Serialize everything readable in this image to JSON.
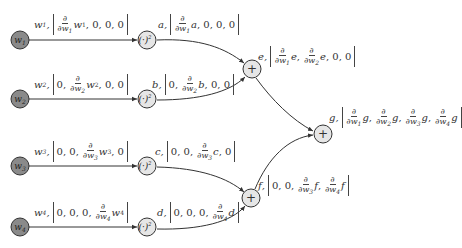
{
  "colors": {
    "input_node_fill": "#8a8a8a",
    "op_node_fill": "#e6e6e6",
    "stroke": "#333333"
  },
  "inputs": [
    {
      "id": "w1",
      "label": "w",
      "sub": "1",
      "cx": 20,
      "cy": 40,
      "tuple_var": "w",
      "tuple_sub": "1",
      "vector": [
        "∂/∂w₁ w₁",
        "0",
        "0",
        "0"
      ]
    },
    {
      "id": "w2",
      "label": "w",
      "sub": "2",
      "cx": 20,
      "cy": 99,
      "tuple_var": "w",
      "tuple_sub": "2",
      "vector": [
        "0",
        "∂/∂w₂ w₂",
        "0",
        "0"
      ]
    },
    {
      "id": "w3",
      "label": "w",
      "sub": "3",
      "cx": 20,
      "cy": 166,
      "tuple_var": "w",
      "tuple_sub": "3",
      "vector": [
        "0",
        "0",
        "∂/∂w₃ w₃",
        "0"
      ]
    },
    {
      "id": "w4",
      "label": "w",
      "sub": "4",
      "cx": 20,
      "cy": 227,
      "tuple_var": "w",
      "tuple_sub": "4",
      "vector": [
        "0",
        "0",
        "0",
        "∂/∂w₄ w₄"
      ]
    }
  ],
  "square_nodes": [
    {
      "id": "a",
      "label": "(·)²",
      "cx": 147,
      "cy": 40,
      "var": "a",
      "vector": [
        "∂/∂w₁ a",
        "0",
        "0",
        "0"
      ]
    },
    {
      "id": "b",
      "label": "(·)²",
      "cx": 147,
      "cy": 99,
      "var": "b",
      "vector": [
        "0",
        "∂/∂w₂ b",
        "0",
        "0"
      ]
    },
    {
      "id": "c",
      "label": "(·)²",
      "cx": 147,
      "cy": 166,
      "var": "c",
      "vector": [
        "0",
        "0",
        "∂/∂w₃ c",
        "0"
      ]
    },
    {
      "id": "d",
      "label": "(·)²",
      "cx": 147,
      "cy": 227,
      "var": "d",
      "vector": [
        "0",
        "0",
        "0",
        "∂/∂w₄ d"
      ]
    }
  ],
  "sum_nodes": [
    {
      "id": "e",
      "label": "+",
      "cx": 252,
      "cy": 69,
      "var": "e",
      "vector": [
        "∂/∂w₁ e",
        "∂/∂w₂ e",
        "0",
        "0"
      ]
    },
    {
      "id": "f",
      "label": "+",
      "cx": 251,
      "cy": 198,
      "var": "f",
      "vector": [
        "0",
        "0",
        "∂/∂w₃ f",
        "∂/∂w₄ f"
      ]
    },
    {
      "id": "g",
      "label": "+",
      "cx": 323,
      "cy": 134,
      "var": "g",
      "vector": [
        "∂/∂w₁ g",
        "∂/∂w₂ g",
        "∂/∂w₃ g",
        "∂/∂w₄ g"
      ]
    }
  ],
  "edges": [
    {
      "from": "w1",
      "to": "a"
    },
    {
      "from": "w2",
      "to": "b"
    },
    {
      "from": "w3",
      "to": "c"
    },
    {
      "from": "w4",
      "to": "d"
    },
    {
      "from": "a",
      "to": "e"
    },
    {
      "from": "b",
      "to": "e"
    },
    {
      "from": "c",
      "to": "f"
    },
    {
      "from": "d",
      "to": "f"
    },
    {
      "from": "e",
      "to": "g"
    },
    {
      "from": "f",
      "to": "g"
    }
  ],
  "text": {
    "zero": "0",
    "comma": ",",
    "partial": "∂",
    "square": "(·)",
    "sq_exp": "2",
    "plus": "+",
    "w": "w",
    "a": "a",
    "b": "b",
    "c": "c",
    "d": "d",
    "e": "e",
    "f": "f",
    "g": "g",
    "s1": "1",
    "s2": "2",
    "s3": "3",
    "s4": "4"
  }
}
